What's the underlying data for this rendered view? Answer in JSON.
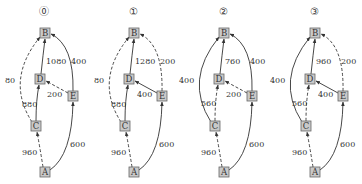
{
  "diagrams": [
    {
      "title": "⓪",
      "offset_x": 0,
      "edges": [
        {
          "from": "A",
          "to": "C",
          "label": "960",
          "style": "dashed"
        },
        {
          "from": "C",
          "to": "B",
          "label": "80",
          "style": "dashed"
        },
        {
          "from": "C",
          "to": "D",
          "label": "880",
          "style": "solid"
        },
        {
          "from": "D",
          "to": "B",
          "label": "1080",
          "style": "solid"
        },
        {
          "from": "E",
          "to": "D",
          "label": "200",
          "style": "dashed"
        },
        {
          "from": "A",
          "to": "E",
          "label": "600",
          "style": "solid"
        },
        {
          "from": "E",
          "to": "B",
          "label": "400",
          "style": "solid"
        }
      ]
    },
    {
      "title": "①",
      "offset_x": 89,
      "edges": [
        {
          "from": "A",
          "to": "C",
          "label": "960",
          "style": "dashed"
        },
        {
          "from": "C",
          "to": "B",
          "label": "80",
          "style": "dashed"
        },
        {
          "from": "C",
          "to": "D",
          "label": "880",
          "style": "solid"
        },
        {
          "from": "D",
          "to": "B",
          "label": "1280",
          "style": "solid"
        },
        {
          "from": "E",
          "to": "D",
          "label": "400",
          "style": "solid"
        },
        {
          "from": "A",
          "to": "E",
          "label": "600",
          "style": "solid"
        },
        {
          "from": "E",
          "to": "B",
          "label": "200",
          "style": "dashed"
        }
      ]
    },
    {
      "title": "②",
      "offset_x": 179,
      "edges": [
        {
          "from": "A",
          "to": "C",
          "label": "960",
          "style": "dashed"
        },
        {
          "from": "C",
          "to": "B",
          "label": "400",
          "style": "solid"
        },
        {
          "from": "C",
          "to": "D",
          "label": "560",
          "style": "dashed"
        },
        {
          "from": "D",
          "to": "B",
          "label": "760",
          "style": "solid"
        },
        {
          "from": "E",
          "to": "D",
          "label": "200",
          "style": "dashed"
        },
        {
          "from": "A",
          "to": "E",
          "label": "600",
          "style": "solid"
        },
        {
          "from": "E",
          "to": "B",
          "label": "400",
          "style": "solid"
        }
      ]
    },
    {
      "title": "③",
      "offset_x": 270,
      "edges": [
        {
          "from": "A",
          "to": "C",
          "label": "960",
          "style": "dashed"
        },
        {
          "from": "C",
          "to": "B",
          "label": "400",
          "style": "solid"
        },
        {
          "from": "C",
          "to": "D",
          "label": "560",
          "style": "dashed"
        },
        {
          "from": "D",
          "to": "B",
          "label": "960",
          "style": "solid"
        },
        {
          "from": "E",
          "to": "D",
          "label": "400",
          "style": "solid"
        },
        {
          "from": "A",
          "to": "E",
          "label": "600",
          "style": "solid"
        },
        {
          "from": "E",
          "to": "B",
          "label": "200",
          "style": "dashed"
        }
      ]
    }
  ],
  "nodes": [
    "A",
    "B",
    "C",
    "D",
    "E"
  ]
}
